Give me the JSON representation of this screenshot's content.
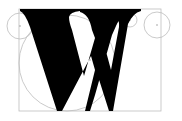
{
  "diagram": {
    "type": "letter-construction",
    "letter": "W",
    "colors": {
      "background": "#ffffff",
      "glyph": "#000000",
      "guide": "#bdbdbd",
      "center_dot": "#888888"
    },
    "bounding_box": {
      "x": 19,
      "y": 9,
      "width": 142,
      "height": 102
    },
    "guide_circles": [
      {
        "name": "large-arc-circle",
        "cx": 67,
        "cy": 63,
        "r": 48
      },
      {
        "name": "left-outer-circle",
        "cx": 20,
        "cy": 26,
        "r": 13
      },
      {
        "name": "left-inner-circle",
        "cx": 52,
        "cy": 20,
        "r": 7
      },
      {
        "name": "center-left-circle",
        "cx": 104,
        "cy": 20,
        "r": 7
      },
      {
        "name": "center-right-circle",
        "cx": 130,
        "cy": 20,
        "r": 7
      },
      {
        "name": "right-outer-circle",
        "cx": 157,
        "cy": 25,
        "r": 13
      }
    ],
    "center_points": [
      {
        "x": 67,
        "y": 63
      },
      {
        "x": 90,
        "y": 60
      },
      {
        "x": 20,
        "y": 26
      },
      {
        "x": 52,
        "y": 20
      },
      {
        "x": 104,
        "y": 20
      },
      {
        "x": 130,
        "y": 20
      },
      {
        "x": 157,
        "y": 25
      }
    ]
  }
}
